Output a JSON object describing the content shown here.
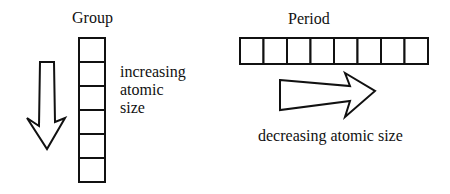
{
  "group": {
    "title": "Group",
    "description_lines": [
      "increasing",
      "atomic",
      "size"
    ],
    "cells": 6,
    "arrow_direction": "down"
  },
  "period": {
    "title": "Period",
    "description": "decreasing atomic size",
    "cells": 8,
    "arrow_direction": "right"
  }
}
